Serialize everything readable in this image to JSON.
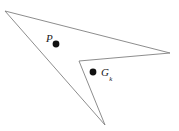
{
  "figure": {
    "name": "concave-polygon-with-interior-points",
    "width": 179,
    "height": 131,
    "background_color": "#ffffff",
    "outline_color": "#808080",
    "outline_width": 0.9,
    "fill_color": "none",
    "point_color": "#111111"
  },
  "polygon": {
    "vertex_count": 5,
    "vertices": [
      {
        "id": "v1",
        "x": 5,
        "y": 11,
        "role": "top-left-apex"
      },
      {
        "id": "v2",
        "x": 170,
        "y": 53,
        "role": "right-tip"
      },
      {
        "id": "v3",
        "x": 79,
        "y": 61,
        "role": "reflex-notch"
      },
      {
        "id": "v4",
        "x": 105,
        "y": 125,
        "role": "bottom-tip"
      },
      {
        "id": "v5",
        "x": 5,
        "y": 11,
        "role": "closing"
      }
    ],
    "path": "M 5 11 L 170 53 L 79 61 L 105 125 Z"
  },
  "points": [
    {
      "id": "point-P",
      "label": "P",
      "subscript": "",
      "dot": {
        "x": 56,
        "y": 44,
        "radius": 3.4
      },
      "label_position": {
        "x": 46,
        "y": 33
      }
    },
    {
      "id": "point-G",
      "label": "G",
      "subscript": "k",
      "dot": {
        "x": 93,
        "y": 72,
        "radius": 3.4
      },
      "label_position": {
        "x": 101,
        "y": 67
      }
    }
  ]
}
